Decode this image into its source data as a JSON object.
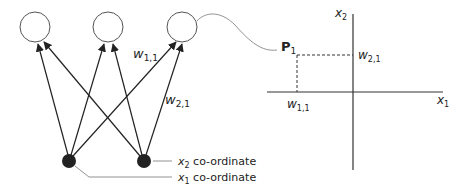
{
  "diagram": {
    "network": {
      "output_nodes": [
        {
          "id": "out-1",
          "cx": 35,
          "cy": 27,
          "r": 15
        },
        {
          "id": "out-2",
          "cx": 108,
          "cy": 27,
          "r": 15
        },
        {
          "id": "out-3",
          "cx": 182,
          "cy": 27,
          "r": 15
        }
      ],
      "input_nodes": [
        {
          "id": "in-1",
          "cx": 69,
          "cy": 161,
          "r": 7
        },
        {
          "id": "in-2",
          "cx": 144,
          "cy": 161,
          "r": 7
        }
      ],
      "weight_labels": {
        "w11": {
          "base": "w",
          "sub": "1,1"
        },
        "w21": {
          "base": "w",
          "sub": "2,1"
        }
      },
      "input_labels": {
        "x2": {
          "base": "x",
          "sub": "2",
          "text": " co-ordinate"
        },
        "x1": {
          "base": "x",
          "sub": "1",
          "text": " co-ordinate"
        }
      }
    },
    "plot": {
      "point_label": {
        "base": "P",
        "sub": "1"
      },
      "x_axis_label": {
        "base": "x",
        "sub": "1"
      },
      "y_axis_label": {
        "base": "x",
        "sub": "2"
      },
      "x_tick_label": {
        "base": "w",
        "sub": "1,1"
      },
      "y_tick_label": {
        "base": "w",
        "sub": "2,1"
      }
    },
    "colors": {
      "line": "#222222",
      "thin_line": "#777777",
      "node_fill": "#222222"
    }
  }
}
